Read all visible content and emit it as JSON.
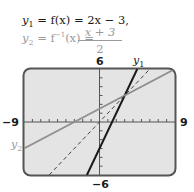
{
  "equations": {
    "y1": {
      "lhs": "y",
      "sub": "1",
      "text": " = f(x) = 2x − 3,"
    },
    "y2": {
      "lhs": "y",
      "sub": "2",
      "text": " = f",
      "sup": "−1",
      "tail": "(x) = ",
      "numerator": "x + 3",
      "denominator": "2"
    }
  },
  "axis_labels": {
    "ymax": "6",
    "ymin": "−6",
    "xmin": "−9",
    "xmax": "9"
  },
  "curve_labels": {
    "y1": "y",
    "y1_sub": "1",
    "y2": "y",
    "y2_sub": "2"
  },
  "colors": {
    "frame": "#555555",
    "background": "#e4e4e4",
    "y1": "#1a1a1a",
    "y2": "#8f8f8f",
    "identity": "#444444"
  },
  "chart_data": {
    "type": "line",
    "title": "",
    "xlabel": "",
    "ylabel": "",
    "xlim": [
      -9,
      9
    ],
    "ylim": [
      -6,
      6
    ],
    "xtick_step": 1,
    "ytick_step": 1,
    "grid": false,
    "series": [
      {
        "name": "y1 = f(x) = 2x − 3",
        "style": "solid",
        "color": "#1a1a1a",
        "x": [
          -1.5,
          4.5
        ],
        "y": [
          -6,
          6
        ]
      },
      {
        "name": "y2 = f^-1(x) = (x + 3)/2",
        "style": "solid",
        "color": "#8f8f8f",
        "x": [
          -9,
          9
        ],
        "y": [
          -3,
          6
        ]
      },
      {
        "name": "y = x",
        "style": "dashed",
        "color": "#444444",
        "x": [
          -6,
          6
        ],
        "y": [
          -6,
          6
        ]
      }
    ],
    "annotations": [
      {
        "text": "y1",
        "near": "top of y1 line"
      },
      {
        "text": "y2",
        "near": "left end of y2 line"
      },
      {
        "text": "intersection",
        "x": 3,
        "y": 3
      }
    ]
  }
}
